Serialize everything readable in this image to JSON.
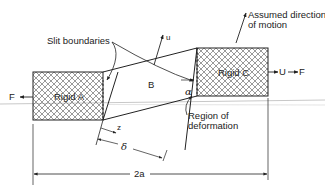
{
  "diagram": {
    "labels": {
      "slit_boundaries": "Slit boundaries",
      "assumed_direction_line1": "Assumed direction",
      "assumed_direction_line2": "of motion",
      "rigid_a": "Rigid A",
      "rigid_c": "Rigid C",
      "region_b": "B",
      "velocity_u": "u",
      "force_left": "F",
      "velocity_right": "U",
      "force_right": "F",
      "angle_alpha": "α",
      "region_line1": "Region of",
      "region_line2": "deformation",
      "dim_z": "z",
      "dim_delta": "δ",
      "dim_2a": "2a"
    },
    "colors": {
      "line": "#222222",
      "hatch": "#555555",
      "guide": "#c8c8c8",
      "background": "#ffffff"
    }
  }
}
